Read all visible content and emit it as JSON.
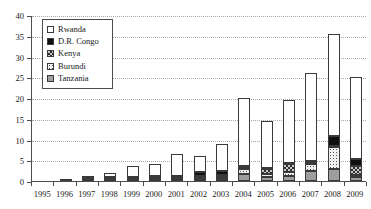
{
  "chart_data": {
    "type": "bar",
    "subtype": "stacked-bar",
    "title": "",
    "xlabel": "",
    "ylabel": "",
    "categories": [
      "1995",
      "1996",
      "1997",
      "1998",
      "1999",
      "2000",
      "2001",
      "2002",
      "2003",
      "2004",
      "2005",
      "2006",
      "2007",
      "2008",
      "2009"
    ],
    "series": [
      {
        "name": "Tanzania",
        "swatch": "gray-solid",
        "color": "#9e9e9e",
        "values": [
          0,
          0.3,
          0.6,
          0.3,
          0.3,
          0.4,
          0.4,
          0.5,
          0.6,
          1.6,
          1.0,
          1.2,
          2.4,
          3.0,
          1.0
        ]
      },
      {
        "name": "Burundi",
        "swatch": "light-dotted",
        "color": "#f0f0f0",
        "values": [
          0,
          0,
          0,
          0.3,
          0.3,
          0.3,
          0.3,
          0.4,
          0.4,
          1.2,
          0.6,
          1.0,
          1.6,
          5.2,
          0.4
        ]
      },
      {
        "name": "Kenya",
        "swatch": "cross-hatch",
        "color": "#c9c9c9",
        "values": [
          0,
          0,
          0,
          0.2,
          0.2,
          0.2,
          0.3,
          0.3,
          0.4,
          0.4,
          1.2,
          1.8,
          0.3,
          0.3,
          2.2
        ]
      },
      {
        "name": "D.R. Congo",
        "swatch": "black-solid",
        "color": "#101010",
        "values": [
          0,
          0,
          0.1,
          0.2,
          0.2,
          0.2,
          0.3,
          1.0,
          1.1,
          0.5,
          0.4,
          0.4,
          0.6,
          2.4,
          1.6
        ]
      },
      {
        "name": "Rwanda",
        "swatch": "white-solid",
        "color": "#ffffff",
        "values": [
          0,
          0,
          0.3,
          1.0,
          2.5,
          2.9,
          5.2,
          3.8,
          6.5,
          16.3,
          11.3,
          15.1,
          21.1,
          24.6,
          19.8
        ]
      }
    ],
    "totals": [
      0,
      0.3,
      1.0,
      2.0,
      3.5,
      4.0,
      6.5,
      6.0,
      9.0,
      20.0,
      14.5,
      19.5,
      26.0,
      35.5,
      25.0
    ],
    "ylim": [
      0,
      40
    ],
    "y_ticks": [
      0,
      5,
      10,
      15,
      20,
      25,
      30,
      35,
      40
    ],
    "y_tick_labels": [
      "0",
      "5",
      "10",
      "15",
      "20",
      "25",
      "30",
      "35",
      "40"
    ],
    "grid": {
      "horizontal": true,
      "vertical": false,
      "style": "dotted"
    },
    "legend": {
      "position": "top-left",
      "entries": [
        "Rwanda",
        "D.R. Congo",
        "Kenya",
        "Burundi",
        "Tanzania"
      ]
    },
    "stack_order_bottom_to_top": [
      "Tanzania",
      "Burundi",
      "Kenya",
      "D.R. Congo",
      "Rwanda"
    ]
  },
  "axis": {
    "y_labels": [
      "40",
      "35",
      "30",
      "25",
      "20",
      "15",
      "10",
      "5",
      "0"
    ],
    "x_labels": [
      "1995",
      "1996",
      "1997",
      "1998",
      "1999",
      "2000",
      "2001",
      "2002",
      "2003",
      "2004",
      "2005",
      "2006",
      "2007",
      "2008",
      "2009"
    ]
  },
  "legend": {
    "items": [
      {
        "label": "Rwanda"
      },
      {
        "label": "D.R. Congo"
      },
      {
        "label": "Kenya"
      },
      {
        "label": "Burundi"
      },
      {
        "label": "Tanzania"
      }
    ]
  }
}
